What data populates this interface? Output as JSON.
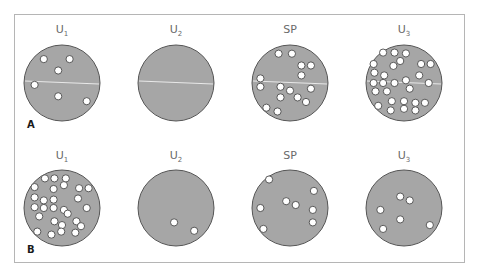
{
  "figure": {
    "colors": {
      "dish_fill": "#a6a6a6",
      "dish_stroke": "#555555",
      "cell_fill": "#ffffff",
      "divider": "#e8e8e8",
      "frame": "#b5b5b5"
    },
    "panels": [
      {
        "id": "A",
        "label": "A",
        "has_divider": true,
        "dishes": [
          {
            "name": "U",
            "sub": "1",
            "cell_count": 6,
            "cells": [
              [
                -0.48,
                -0.63
              ],
              [
                0.2,
                -0.63
              ],
              [
                -0.1,
                -0.33
              ],
              [
                -0.72,
                0.05
              ],
              [
                -0.1,
                0.35
              ],
              [
                0.65,
                0.48
              ]
            ]
          },
          {
            "name": "U",
            "sub": "2",
            "cell_count": 0,
            "cells": []
          },
          {
            "name": "SP",
            "sub": "",
            "cell_count": 15,
            "cells": [
              [
                -0.3,
                -0.77
              ],
              [
                0.05,
                -0.77
              ],
              [
                0.3,
                -0.46
              ],
              [
                0.55,
                -0.46
              ],
              [
                0.3,
                -0.2
              ],
              [
                -0.78,
                -0.12
              ],
              [
                -0.78,
                0.1
              ],
              [
                -0.25,
                0.1
              ],
              [
                0.0,
                0.2
              ],
              [
                0.55,
                0.15
              ],
              [
                -0.25,
                0.38
              ],
              [
                0.2,
                0.38
              ],
              [
                0.42,
                0.5
              ],
              [
                -0.62,
                0.65
              ],
              [
                -0.33,
                0.75
              ]
            ]
          },
          {
            "name": "U",
            "sub": "3",
            "cell_count": 27,
            "cells": [
              [
                -0.55,
                -0.8
              ],
              [
                -0.25,
                -0.8
              ],
              [
                0.05,
                -0.78
              ],
              [
                -0.1,
                -0.58
              ],
              [
                -0.8,
                -0.5
              ],
              [
                -0.28,
                -0.45
              ],
              [
                0.45,
                -0.5
              ],
              [
                0.7,
                -0.5
              ],
              [
                -0.78,
                -0.27
              ],
              [
                -0.52,
                -0.2
              ],
              [
                0.4,
                -0.2
              ],
              [
                -0.8,
                0.0
              ],
              [
                -0.55,
                0.0
              ],
              [
                -0.25,
                0.0
              ],
              [
                0.05,
                -0.07
              ],
              [
                0.65,
                0.0
              ],
              [
                -0.75,
                0.22
              ],
              [
                -0.45,
                0.22
              ],
              [
                0.15,
                0.15
              ],
              [
                0.0,
                0.48
              ],
              [
                -0.32,
                0.48
              ],
              [
                -0.68,
                0.6
              ],
              [
                -0.35,
                0.72
              ],
              [
                0.3,
                0.52
              ],
              [
                0.55,
                0.52
              ],
              [
                0.3,
                0.72
              ],
              [
                0.0,
                0.68
              ]
            ]
          }
        ]
      },
      {
        "id": "B",
        "label": "B",
        "has_divider": false,
        "dishes": [
          {
            "name": "U",
            "sub": "1",
            "cell_count": 27,
            "cells": [
              [
                -0.45,
                -0.78
              ],
              [
                -0.2,
                -0.78
              ],
              [
                0.1,
                -0.78
              ],
              [
                0.05,
                -0.6
              ],
              [
                -0.72,
                -0.55
              ],
              [
                -0.22,
                -0.5
              ],
              [
                0.45,
                -0.52
              ],
              [
                0.7,
                -0.52
              ],
              [
                -0.72,
                -0.28
              ],
              [
                -0.48,
                -0.2
              ],
              [
                -0.22,
                -0.22
              ],
              [
                0.42,
                -0.25
              ],
              [
                -0.72,
                -0.02
              ],
              [
                -0.48,
                0.0
              ],
              [
                -0.22,
                0.0
              ],
              [
                0.05,
                0.05
              ],
              [
                0.15,
                0.15
              ],
              [
                0.65,
                0.0
              ],
              [
                -0.6,
                0.22
              ],
              [
                -0.2,
                0.35
              ],
              [
                0.0,
                0.45
              ],
              [
                0.38,
                0.35
              ],
              [
                0.5,
                0.48
              ],
              [
                -0.65,
                0.62
              ],
              [
                -0.28,
                0.7
              ],
              [
                0.35,
                0.65
              ],
              [
                -0.02,
                0.62
              ]
            ]
          },
          {
            "name": "U",
            "sub": "2",
            "cell_count": 2,
            "cells": [
              [
                -0.05,
                0.38
              ],
              [
                0.48,
                0.6
              ]
            ]
          },
          {
            "name": "SP",
            "sub": "",
            "cell_count": 8,
            "cells": [
              [
                -0.55,
                -0.75
              ],
              [
                -0.1,
                -0.18
              ],
              [
                0.15,
                -0.08
              ],
              [
                0.63,
                -0.45
              ],
              [
                -0.78,
                0.0
              ],
              [
                0.6,
                0.05
              ],
              [
                0.6,
                0.38
              ],
              [
                -0.7,
                0.55
              ]
            ]
          },
          {
            "name": "U",
            "sub": "3",
            "cell_count": 6,
            "cells": [
              [
                -0.1,
                -0.3
              ],
              [
                0.15,
                -0.2
              ],
              [
                -0.62,
                0.05
              ],
              [
                -0.1,
                0.3
              ],
              [
                -0.55,
                0.55
              ],
              [
                0.68,
                0.45
              ]
            ]
          }
        ]
      }
    ]
  }
}
